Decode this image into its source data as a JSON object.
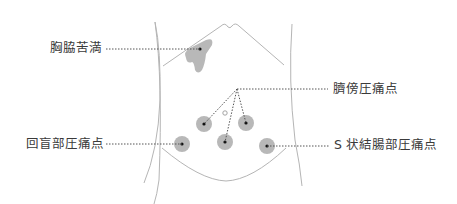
{
  "diagram": {
    "colors": {
      "outline": "#b5b5b5",
      "spot_fill": "#b8b8b8",
      "dot": "#111111",
      "leader": "#555555",
      "text": "#3a3a3a",
      "navel": "#9a9a9a"
    },
    "labels": {
      "chest": "胸脇苦満",
      "paraumbilical": "臍傍圧痛点",
      "ileocecal": "回盲部圧痛点",
      "sigmoid": "S 状結腸部圧痛点"
    },
    "points": [
      {
        "name": "chest-fullness",
        "x": 200,
        "y": 49,
        "kind": "blob"
      },
      {
        "name": "paraumbilical-left",
        "x": 204,
        "y": 124,
        "r": 8
      },
      {
        "name": "paraumbilical-lower",
        "x": 225,
        "y": 142,
        "r": 8
      },
      {
        "name": "paraumbilical-right",
        "x": 246,
        "y": 123,
        "r": 8
      },
      {
        "name": "ileocecal",
        "x": 182,
        "y": 144,
        "r": 8
      },
      {
        "name": "sigmoid",
        "x": 267,
        "y": 146,
        "r": 8
      }
    ],
    "convergence_point": {
      "x": 237,
      "y": 89
    }
  }
}
